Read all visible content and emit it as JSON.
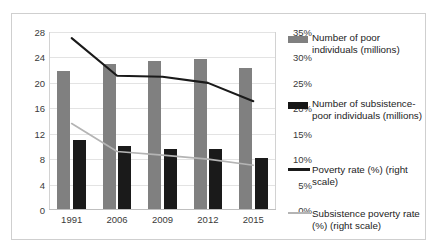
{
  "chart_data": {
    "type": "bar",
    "title": "",
    "xlabel": "",
    "ylabel": "",
    "categories": [
      "1991",
      "2006",
      "2009",
      "2012",
      "2015"
    ],
    "left_axis": {
      "label": "",
      "ticks": [
        "0",
        "4",
        "8",
        "12",
        "16",
        "20",
        "24",
        "28"
      ],
      "tick_values": [
        0,
        4,
        8,
        12,
        16,
        20,
        24,
        28
      ],
      "ylim": [
        0,
        28
      ]
    },
    "right_axis": {
      "label": "",
      "ticks": [
        "0%",
        "5%",
        "10%",
        "15%",
        "20%",
        "25%",
        "30%",
        "35%"
      ],
      "tick_values": [
        0,
        5,
        10,
        15,
        20,
        25,
        30,
        35
      ],
      "ylim": [
        0,
        35
      ]
    },
    "grid": true,
    "legend_position": "right",
    "series": [
      {
        "name": "Number of poor individuals (millions)",
        "type": "bar",
        "axis": "left",
        "color": "#808080",
        "values": [
          21.8,
          23.0,
          23.4,
          23.8,
          22.3
        ]
      },
      {
        "name": "Number of subsistence-poor individuals (millions)",
        "type": "bar",
        "axis": "left",
        "color": "#1a1a1a",
        "values": [
          11.0,
          10.0,
          9.6,
          9.6,
          8.2
        ]
      },
      {
        "name": "Poverty rate (%) (right scale)",
        "type": "line",
        "axis": "right",
        "color": "#1a1a1a",
        "values": [
          33.8,
          26.4,
          26.2,
          25.0,
          21.4
        ]
      },
      {
        "name": "Subsistence poverty rate (%) (right scale)",
        "type": "line",
        "axis": "right",
        "color": "#b4b4b4",
        "values": [
          17.0,
          11.5,
          10.8,
          10.0,
          8.8
        ]
      }
    ]
  },
  "legend": {
    "items": [
      {
        "label": "Number of poor individuals (millions)",
        "marker": "bar-swatch-gray"
      },
      {
        "label": "Number of subsistence-poor individuals (millions)",
        "marker": "bar-swatch-black"
      },
      {
        "label": "Poverty rate (%) (right scale)",
        "marker": "line-swatch-black"
      },
      {
        "label": "Subsistence poverty rate (%) (right scale)",
        "marker": "line-swatch-gray"
      }
    ]
  }
}
